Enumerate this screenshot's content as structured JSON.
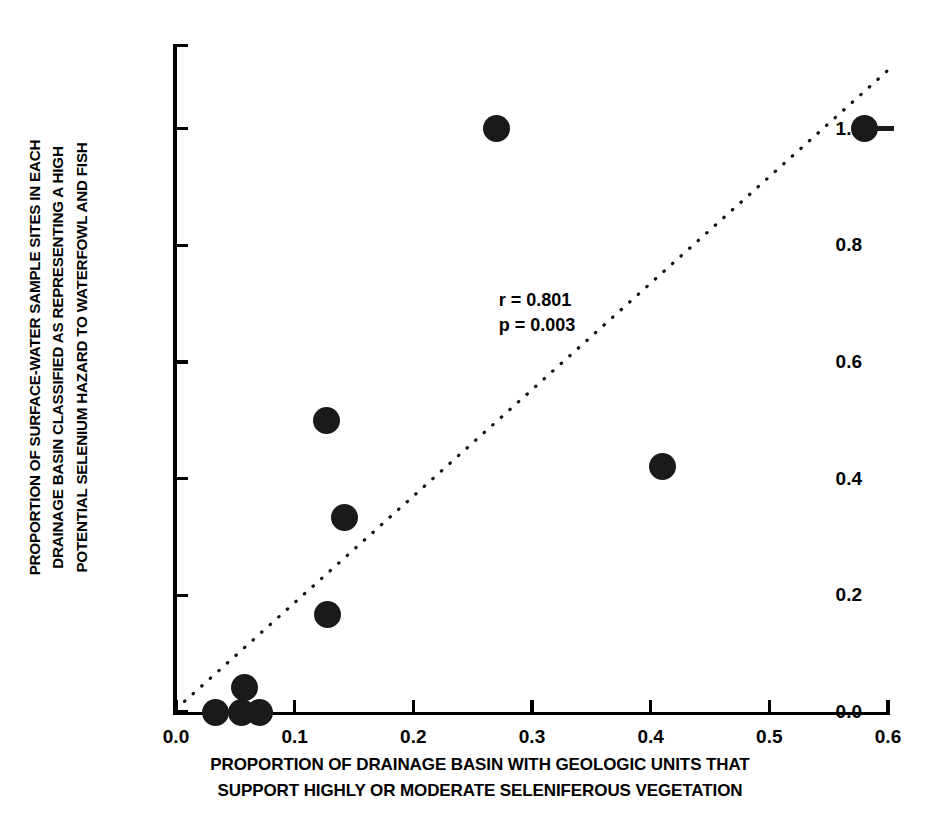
{
  "chart_data": {
    "type": "scatter",
    "title": "",
    "xlabel_lines": [
      "PROPORTION OF DRAINAGE BASIN WITH GEOLOGIC UNITS THAT",
      "SUPPORT HIGHLY OR MODERATE SELENIFEROUS VEGETATION"
    ],
    "ylabel_lines": [
      "PROPORTION OF SURFACE-WATER SAMPLE SITES IN EACH",
      "DRAINAGE BASIN CLASSIFIED AS REPRESENTING A HIGH",
      "POTENTIAL SELENIUM HAZARD TO WATERFOWL AND FISH"
    ],
    "xlim": [
      0.0,
      0.6
    ],
    "ylim": [
      0.0,
      1.145
    ],
    "xticks": [
      0.0,
      0.1,
      0.2,
      0.3,
      0.4,
      0.5,
      0.6
    ],
    "xtick_labels": [
      "0.0",
      "0.1",
      "0.2",
      "0.3",
      "0.4",
      "0.5",
      "0.6"
    ],
    "yticks": [
      0.0,
      0.2,
      0.4,
      0.6,
      0.8,
      1.0
    ],
    "ytick_labels": [
      "0.0",
      "0.2",
      "0.4",
      "0.6",
      "0.8",
      "1.0"
    ],
    "grid": false,
    "legend": "none",
    "marker_color": "#1a1a1a",
    "points": [
      {
        "x": 0.033,
        "y": 0.0
      },
      {
        "x": 0.055,
        "y": 0.0
      },
      {
        "x": 0.058,
        "y": 0.042
      },
      {
        "x": 0.07,
        "y": 0.0
      },
      {
        "x": 0.127,
        "y": 0.5
      },
      {
        "x": 0.128,
        "y": 0.167
      },
      {
        "x": 0.142,
        "y": 0.333
      },
      {
        "x": 0.27,
        "y": 1.0
      },
      {
        "x": 0.41,
        "y": 0.42
      },
      {
        "x": 0.58,
        "y": 1.0
      }
    ],
    "trendline": {
      "style": "dotted",
      "x_start": 0.0,
      "y_start": 0.005,
      "x_end": 0.6,
      "y_end": 1.1
    },
    "annotations": [
      {
        "text": "r = 0.801",
        "x": 0.272,
        "y": 0.705
      },
      {
        "text": "p = 0.003",
        "x": 0.272,
        "y": 0.648
      }
    ]
  }
}
